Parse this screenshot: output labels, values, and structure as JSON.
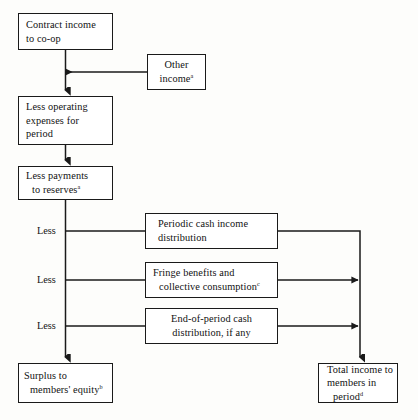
{
  "diagram": {
    "type": "flowchart",
    "background_color": "#fdfdfb",
    "line_color": "#1a1a1a",
    "text_color": "#111111",
    "nodes": [
      {
        "id": "contract-income",
        "lines": [
          "Contract income",
          "to co-op"
        ],
        "superscript": "",
        "align": "left"
      },
      {
        "id": "other-income",
        "lines": [
          "Other",
          "income"
        ],
        "superscript": "a",
        "align": "center"
      },
      {
        "id": "less-operating-expenses",
        "lines": [
          "Less operating",
          "expenses for",
          "period"
        ],
        "superscript": "",
        "align": "left"
      },
      {
        "id": "less-payments-reserves",
        "lines": [
          "Less payments",
          "to reserves"
        ],
        "superscript": "a",
        "align": "left"
      },
      {
        "id": "periodic-cash-income-distribution",
        "lines": [
          "Periodic cash income",
          "distribution"
        ],
        "superscript": "",
        "align": "left"
      },
      {
        "id": "fringe-benefits",
        "lines": [
          "Fringe benefits and",
          "collective consumption"
        ],
        "superscript": "c",
        "align": "left"
      },
      {
        "id": "end-of-period-cash",
        "lines": [
          "End-of-period cash",
          "distribution, if any"
        ],
        "superscript": "",
        "align": "center"
      },
      {
        "id": "surplus-members-equity",
        "lines": [
          "Surplus to",
          "members' equity"
        ],
        "superscript": "b",
        "align": "left"
      },
      {
        "id": "total-income-members",
        "lines": [
          "Total income to",
          "members in",
          "period"
        ],
        "superscript": "d",
        "align": "left"
      }
    ],
    "branch_labels": [
      "Less",
      "Less",
      "Less"
    ]
  }
}
